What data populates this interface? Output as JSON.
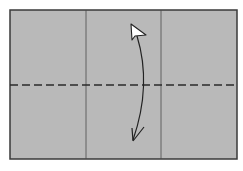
{
  "diagram": {
    "type": "origami-fold-step",
    "paper": {
      "x": 10,
      "y": 10,
      "width": 227,
      "height": 149,
      "fill": "#b9b9b9",
      "border": "#3a3a3a"
    },
    "creases": [
      {
        "kind": "existing-crease",
        "x": 86
      },
      {
        "kind": "existing-crease",
        "x": 161
      }
    ],
    "valley_fold_line": {
      "y": 85,
      "color": "#2a2a2a",
      "dash": "8 4"
    },
    "arrow": {
      "kind": "fold-and-unfold",
      "from": [
        131,
        28
      ],
      "to": [
        133,
        142
      ],
      "color": "#222222"
    }
  }
}
